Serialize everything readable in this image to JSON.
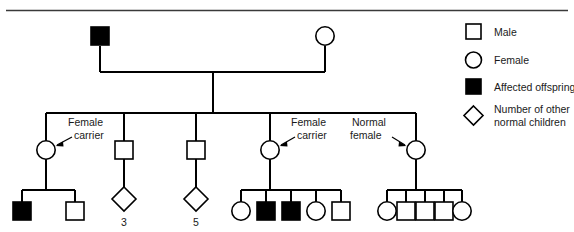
{
  "figure": {
    "type": "pedigree-chart",
    "background_color": "#ffffff",
    "line_color": "#000000",
    "affected_fill": "#000000",
    "unaffected_fill": "#ffffff"
  },
  "legend": {
    "items": [
      {
        "symbol": "open-square",
        "label": "Male"
      },
      {
        "symbol": "open-circle",
        "label": "Female"
      },
      {
        "symbol": "filled-square",
        "label": "Affected offspring"
      },
      {
        "symbol": "open-diamond",
        "label": "Number of other",
        "label2": "normal children"
      }
    ]
  },
  "annotations": {
    "carrier_left": {
      "line1": "Female",
      "line2": "carrier"
    },
    "carrier_mid": {
      "line1": "Female",
      "line2": "carrier"
    },
    "normal_female": {
      "line1": "Normal",
      "line2": "female"
    }
  },
  "generations": {
    "one": {
      "members": [
        {
          "id": "I-1",
          "sex": "male",
          "symbol": "filled-square",
          "affected": true
        },
        {
          "id": "I-2",
          "sex": "female",
          "symbol": "open-circle",
          "affected": false
        }
      ]
    },
    "two": {
      "members": [
        {
          "id": "II-1",
          "sex": "female",
          "symbol": "open-circle",
          "affected": false,
          "note": "Female carrier"
        },
        {
          "id": "II-2",
          "sex": "male",
          "symbol": "open-square",
          "affected": false
        },
        {
          "id": "II-3",
          "sex": "male",
          "symbol": "open-square",
          "affected": false
        },
        {
          "id": "II-4",
          "sex": "female",
          "symbol": "open-circle",
          "affected": false,
          "note": "Female carrier"
        },
        {
          "id": "II-5",
          "sex": "female",
          "symbol": "open-circle",
          "affected": false,
          "note": "Normal female"
        }
      ]
    },
    "three": {
      "sibships": [
        {
          "parent": "II-1",
          "children": [
            {
              "symbol": "filled-square",
              "sex": "male",
              "affected": true
            },
            {
              "symbol": "open-square",
              "sex": "male",
              "affected": false
            }
          ]
        },
        {
          "parent": "II-2",
          "children": [
            {
              "symbol": "open-diamond",
              "count": "3"
            }
          ]
        },
        {
          "parent": "II-3",
          "children": [
            {
              "symbol": "open-diamond",
              "count": "5"
            }
          ]
        },
        {
          "parent": "II-4",
          "children": [
            {
              "symbol": "open-circle",
              "sex": "female",
              "affected": false
            },
            {
              "symbol": "filled-square",
              "sex": "male",
              "affected": true
            },
            {
              "symbol": "filled-square",
              "sex": "male",
              "affected": true
            },
            {
              "symbol": "open-circle",
              "sex": "female",
              "affected": false
            },
            {
              "symbol": "open-square",
              "sex": "male",
              "affected": false
            }
          ]
        },
        {
          "parent": "II-5",
          "children": [
            {
              "symbol": "open-circle",
              "sex": "female",
              "affected": false
            },
            {
              "symbol": "open-square",
              "sex": "male",
              "affected": false
            },
            {
              "symbol": "open-square",
              "sex": "male",
              "affected": false
            },
            {
              "symbol": "open-square",
              "sex": "male",
              "affected": false
            },
            {
              "symbol": "open-circle",
              "sex": "female",
              "affected": false
            }
          ]
        }
      ]
    }
  },
  "counts": {
    "diamond_left": "3",
    "diamond_right": "5"
  }
}
